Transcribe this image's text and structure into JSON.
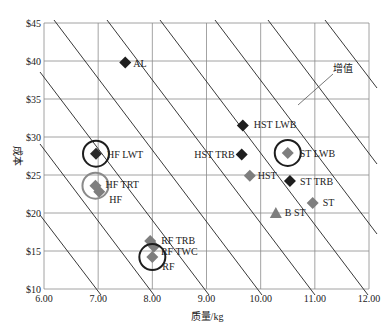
{
  "chart_data": {
    "type": "scatter",
    "title": "",
    "xlabel": "质量/kg",
    "ylabel": "成本",
    "xlim": [
      6.0,
      12.0
    ],
    "ylim": [
      10,
      45
    ],
    "x_ticks": [
      "6.00",
      "7.00",
      "8.00",
      "9.00",
      "10.00",
      "11.00",
      "12.00"
    ],
    "y_ticks": [
      "$10",
      "$15",
      "$20",
      "$25",
      "$30",
      "$35",
      "$40",
      "$45"
    ],
    "grid": true,
    "legend": null,
    "iso_value_lines": {
      "count": 9,
      "annotation": "增值",
      "description": "parallel diagonal iso-value lines sloping downward to the right"
    },
    "points": [
      {
        "label": "AL",
        "x": 7.5,
        "y": 39.8,
        "marker": "diamond",
        "color": "#1e1e1e",
        "circled": false
      },
      {
        "label": "HF LWT",
        "x": 6.96,
        "y": 27.8,
        "marker": "diamond",
        "color": "#2a2a2a",
        "circled": true,
        "circle_color": "#1e1e1e"
      },
      {
        "label": "HF TRT",
        "x": 6.95,
        "y": 23.6,
        "marker": "diamond",
        "color": "#7e7e7e",
        "circled": true,
        "circle_color": "#8a8a8a"
      },
      {
        "label": "HF",
        "x": 7.02,
        "y": 22.8,
        "marker": "diamond",
        "color": "#7e7e7e",
        "circled": false
      },
      {
        "label": "RF TRB",
        "x": 7.96,
        "y": 16.3,
        "marker": "diamond",
        "color": "#7e7e7e",
        "circled": false
      },
      {
        "label": "RF TWC",
        "x": 8.03,
        "y": 15.6,
        "marker": "diamond",
        "color": "#7e7e7e",
        "circled": false
      },
      {
        "label": "RF",
        "x": 8.0,
        "y": 14.2,
        "marker": "diamond",
        "color": "#7e7e7e",
        "circled": true,
        "circle_color": "#1e1e1e"
      },
      {
        "label": "HST LWB",
        "x": 9.67,
        "y": 31.5,
        "marker": "diamond",
        "color": "#1e1e1e",
        "circled": false
      },
      {
        "label": "HST TRB",
        "x": 9.65,
        "y": 27.7,
        "marker": "diamond",
        "color": "#1e1e1e",
        "circled": false
      },
      {
        "label": "HST",
        "x": 9.8,
        "y": 24.9,
        "marker": "diamond",
        "color": "#7e7e7e",
        "circled": false
      },
      {
        "label": "ST LWB",
        "x": 10.5,
        "y": 27.9,
        "marker": "diamond",
        "color": "#7e7e7e",
        "circled": true,
        "circle_color": "#1e1e1e"
      },
      {
        "label": "ST TRB",
        "x": 10.54,
        "y": 24.2,
        "marker": "diamond",
        "color": "#1e1e1e",
        "circled": false
      },
      {
        "label": "ST",
        "x": 10.96,
        "y": 21.3,
        "marker": "diamond",
        "color": "#7e7e7e",
        "circled": false
      },
      {
        "label": "B ST",
        "x": 10.28,
        "y": 20.0,
        "marker": "triangle",
        "color": "#7e7e7e",
        "circled": false
      }
    ]
  }
}
